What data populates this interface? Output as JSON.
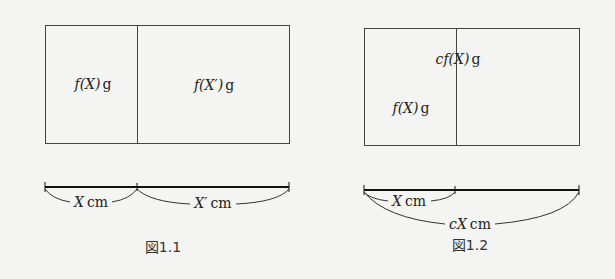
{
  "figures": [
    {
      "caption": "図1.1",
      "regions": [
        {
          "label_fn": "f",
          "label_arg": "(X)",
          "label_unit": "g"
        },
        {
          "label_fn": "f",
          "label_arg": "(X′)",
          "label_unit": "g"
        }
      ],
      "segments": [
        {
          "var": "X",
          "unit": "cm"
        },
        {
          "var": "X′",
          "unit": "cm"
        }
      ]
    },
    {
      "caption": "図1.2",
      "regions": [
        {
          "label_prefix": "c",
          "label_fn": "f",
          "label_arg": "(X)",
          "label_unit": "g"
        },
        {
          "label_fn": "f",
          "label_arg": "(X)",
          "label_unit": "g"
        }
      ],
      "segments": [
        {
          "var": "X",
          "unit": "cm"
        },
        {
          "prefix": "c",
          "var": "X",
          "unit": "cm"
        }
      ]
    }
  ]
}
